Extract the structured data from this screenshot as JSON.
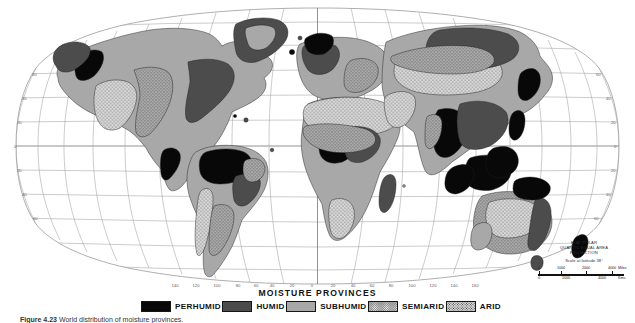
{
  "figure": {
    "caption_label": "Figure 4.23",
    "caption_text": "World distribution of moisture provinces."
  },
  "map": {
    "title": "MOISTURE  PROVINCES",
    "projection_lines": [
      "FLAT POLAR",
      "QUARTIC EQUAL AREA",
      "PROJECTION"
    ],
    "scale_caption": "Scale at latitude 38°",
    "scale": {
      "miles": {
        "unit": "Miles",
        "labels": [
          "0",
          "1000",
          "2000",
          "4000"
        ]
      },
      "kms": {
        "unit": "Kms.",
        "labels": [
          "0",
          "1000",
          "4000"
        ]
      }
    },
    "longitude_labels": [
      "140",
      "120",
      "100",
      "80",
      "60",
      "40",
      "20",
      "0",
      "20",
      "40",
      "60",
      "80",
      "100",
      "120",
      "140",
      "160"
    ],
    "latitude_labels_left": [
      "60",
      "40",
      "20",
      "0",
      "20",
      "40",
      "60"
    ],
    "latitude_labels_right": [
      "60",
      "40",
      "20",
      "0",
      "20",
      "40",
      "60"
    ],
    "colors": {
      "perhumid": "#080808",
      "humid": "#4c4c4c",
      "subhumid": "#a8a8a8",
      "semiarid": "#8f8f8f",
      "arid": "#d6d6d6",
      "ocean": "#ffffff",
      "graticule": "#9a9a9a",
      "coastline": "#1a1a1a"
    }
  },
  "legend": {
    "title": "MOISTURE  PROVINCES",
    "entries": [
      {
        "label": "PERHUMID",
        "swatch": "perhumid-swatch"
      },
      {
        "label": "HUMID",
        "swatch": "humid-swatch"
      },
      {
        "label": "SUBHUMID",
        "swatch": "subhumid-swatch"
      },
      {
        "label": "SEMIARID",
        "swatch": "semiarid-swatch"
      },
      {
        "label": "ARID",
        "swatch": "arid-swatch"
      }
    ]
  }
}
